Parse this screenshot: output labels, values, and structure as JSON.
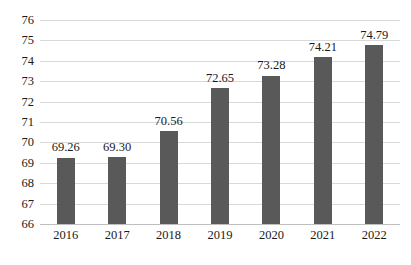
{
  "chart_data": {
    "type": "bar",
    "title": "",
    "subtitle": "",
    "xlabel": "",
    "ylabel": "",
    "categories": [
      "2016",
      "2017",
      "2018",
      "2019",
      "2020",
      "2021",
      "2022"
    ],
    "values": [
      69.26,
      69.3,
      70.56,
      72.65,
      73.28,
      74.21,
      74.79
    ],
    "data_labels": [
      "69.26",
      "69.30",
      "70.56",
      "72.65",
      "73.28",
      "74.21",
      "74.79"
    ],
    "ylim": [
      66,
      76
    ],
    "y_ticks": [
      76,
      75,
      74,
      73,
      72,
      71,
      70,
      69,
      68,
      67,
      66
    ],
    "y_tick_labels": [
      "76",
      "75",
      "74",
      "73",
      "72",
      "71",
      "70",
      "69",
      "68",
      "67",
      "66"
    ],
    "grid": true,
    "grid_axis": "y",
    "legend": null,
    "legend_position": "none",
    "series": [
      {
        "name": "",
        "values": [
          69.26,
          69.3,
          70.56,
          72.65,
          73.28,
          74.21,
          74.79
        ],
        "color": "#595959"
      }
    ],
    "colors": {
      "bar": "#595959",
      "gridline": "#d9d9d9",
      "baseline": "#bfbfbf",
      "text": "#1a1a1a",
      "background": "#ffffff"
    }
  }
}
